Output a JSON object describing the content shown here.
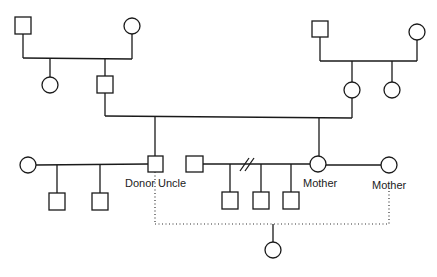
{
  "diagram": {
    "type": "pedigree",
    "labels": {
      "donor_uncle": "Donor Uncle",
      "mother_1": "Mother",
      "mother_2": "Mother"
    },
    "generations": [
      {
        "id": "I",
        "individuals": [
          "paternal-grandfather",
          "paternal-grandmother",
          "maternal-grandfather",
          "maternal-grandmother"
        ]
      },
      {
        "id": "II",
        "individuals": [
          "paternal-aunt",
          "father",
          "mother-of-generation-III",
          "maternal-aunt"
        ]
      },
      {
        "id": "III",
        "individuals": [
          "uncle-wife",
          "donor-uncle",
          "husband",
          "mother",
          "partner-female"
        ]
      },
      {
        "id": "IV",
        "individuals": [
          "cousin-son-1",
          "cousin-son-2",
          "son-1",
          "son-2",
          "son-3",
          "donor-child"
        ]
      }
    ],
    "symbols": {
      "male": "square",
      "female": "circle"
    },
    "relations": [
      "divorce-marker-double-slash",
      "donor-dotted-line"
    ]
  }
}
